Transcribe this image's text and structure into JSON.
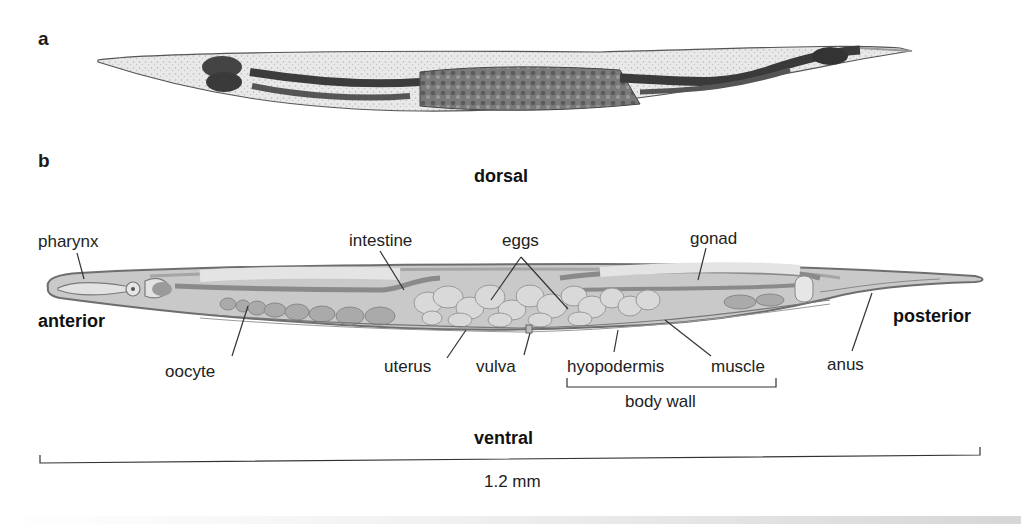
{
  "figure": {
    "panel_a": {
      "letter": "a",
      "content": "micrograph of C. elegans hermaphrodite, lateral view"
    },
    "panel_b": {
      "letter": "b",
      "orientation": {
        "dorsal": "dorsal",
        "ventral": "ventral",
        "anterior": "anterior",
        "posterior": "posterior"
      },
      "labels": {
        "pharynx": "pharynx",
        "intestine": "intestine",
        "eggs": "eggs",
        "gonad": "gonad",
        "oocyte": "oocyte",
        "uterus": "uterus",
        "vulva": "vulva",
        "hyopodermis": "hyopodermis",
        "muscle": "muscle",
        "anus": "anus",
        "body_wall": "body wall"
      },
      "scale_bar": {
        "label": "1.2 mm"
      }
    }
  },
  "colors": {
    "body_fill": "#c9c9c9",
    "body_outline": "#6e6e6e",
    "organ_light": "#e2e2e2",
    "organ_dark": "#8a8a8a",
    "micrograph_dark": "#3a3a3a"
  }
}
